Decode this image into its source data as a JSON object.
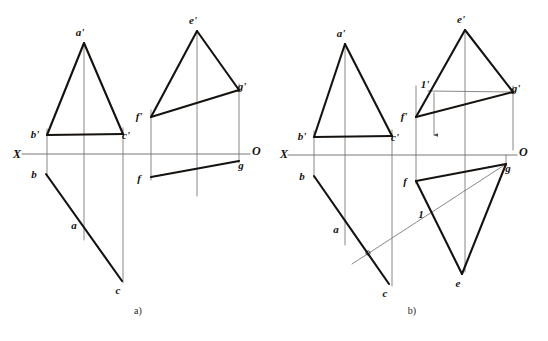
{
  "figure": {
    "type": "descriptive-geometry-projection-drawing",
    "background_color": "#ffffff",
    "ink_color": "#15120f",
    "thin_line_color": "#6e6a66",
    "captions": [
      {
        "id": "caption-a",
        "text": "a)",
        "x": 138,
        "y": 314
      },
      {
        "id": "caption-b",
        "text": "b)",
        "x": 412,
        "y": 314
      }
    ],
    "axes": [
      {
        "id": "axis-a",
        "x1": 22,
        "y1": 154,
        "x2": 250,
        "y2": 154,
        "left_label": "X",
        "left_label_x": 21,
        "left_label_y": 158,
        "right_label": "O",
        "right_label_x": 252,
        "right_label_y": 155
      },
      {
        "id": "axis-b",
        "x1": 288,
        "y1": 155,
        "x2": 517,
        "y2": 155,
        "left_label": "X",
        "left_label_x": 288,
        "left_label_y": 158,
        "right_label": "O",
        "right_label_x": 519,
        "right_label_y": 156
      }
    ],
    "panels": [
      {
        "id": "panel-a",
        "caption": "a)",
        "points": {
          "a_prime": {
            "label": "a'",
            "x": 84,
            "y": 43,
            "lx": 80,
            "ly": 36
          },
          "b_prime": {
            "label": "b'",
            "x": 47,
            "y": 135,
            "lx": 35,
            "ly": 138
          },
          "c_prime": {
            "label": "c'",
            "x": 123,
            "y": 134,
            "lx": 126,
            "ly": 139
          },
          "b": {
            "label": "b",
            "x": 46,
            "y": 174,
            "lx": 34,
            "ly": 178
          },
          "a": {
            "label": "a",
            "x": 76,
            "y": 218,
            "lx": 74,
            "ly": 229
          },
          "c": {
            "label": "c",
            "x": 122,
            "y": 281,
            "lx": 118,
            "ly": 294
          },
          "e_prime": {
            "label": "e'",
            "x": 197,
            "y": 31,
            "lx": 193,
            "ly": 24
          },
          "g_prime": {
            "label": "g'",
            "x": 239,
            "y": 90,
            "lx": 242,
            "ly": 90
          },
          "f_prime": {
            "label": "f'",
            "x": 151,
            "y": 117,
            "lx": 139,
            "ly": 120
          },
          "g": {
            "label": "g",
            "x": 239,
            "y": 161,
            "lx": 241,
            "ly": 169
          },
          "f": {
            "label": "f",
            "x": 151,
            "y": 177,
            "lx": 139,
            "ly": 182
          }
        }
      },
      {
        "id": "panel-b",
        "caption": "b)",
        "points": {
          "a_prime": {
            "label": "a'",
            "x": 345,
            "y": 44,
            "lx": 341,
            "ly": 37
          },
          "b_prime": {
            "label": "b'",
            "x": 314,
            "y": 137,
            "lx": 302,
            "ly": 140
          },
          "c_prime": {
            "label": "c'",
            "x": 392,
            "y": 136,
            "lx": 395,
            "ly": 141
          },
          "b": {
            "label": "b",
            "x": 314,
            "y": 176,
            "lx": 302,
            "ly": 180
          },
          "a": {
            "label": "a",
            "x": 339,
            "y": 222,
            "lx": 336,
            "ly": 233
          },
          "c": {
            "label": "c",
            "x": 389,
            "y": 284,
            "lx": 385,
            "ly": 297
          },
          "k": {
            "label": "",
            "x": 368,
            "y": 253,
            "lx": 0,
            "ly": 0
          },
          "e_prime": {
            "label": "e'",
            "x": 465,
            "y": 30,
            "lx": 461,
            "ly": 23
          },
          "g_prime": {
            "label": "g'",
            "x": 513,
            "y": 92,
            "lx": 516,
            "ly": 92
          },
          "one_prime": {
            "label": "1'",
            "x": 434,
            "y": 91,
            "lx": 425,
            "ly": 88
          },
          "f_prime": {
            "label": "f'",
            "x": 416,
            "y": 117,
            "lx": 404,
            "ly": 120
          },
          "g": {
            "label": "g",
            "x": 506,
            "y": 164,
            "lx": 508,
            "ly": 172
          },
          "f": {
            "label": "f",
            "x": 416,
            "y": 181,
            "lx": 405,
            "ly": 185
          },
          "one": {
            "label": "1",
            "x": 429,
            "y": 212,
            "lx": 421,
            "ly": 218
          },
          "e": {
            "label": "e",
            "x": 462,
            "y": 274,
            "lx": 458,
            "ly": 287
          }
        }
      }
    ],
    "segments_thick_a": [
      {
        "name": "abc-prime-left",
        "x1": 84,
        "y1": 43,
        "x2": 47,
        "y2": 135
      },
      {
        "name": "abc-prime-right",
        "x1": 84,
        "y1": 43,
        "x2": 123,
        "y2": 134
      },
      {
        "name": "abc-prime-base",
        "x1": 47,
        "y1": 135,
        "x2": 123,
        "y2": 134
      },
      {
        "name": "bc-horizontal-proj",
        "x1": 46,
        "y1": 174,
        "x2": 122,
        "y2": 281
      },
      {
        "name": "efg-prime-left",
        "x1": 197,
        "y1": 31,
        "x2": 151,
        "y2": 117
      },
      {
        "name": "efg-prime-right",
        "x1": 197,
        "y1": 31,
        "x2": 239,
        "y2": 90
      },
      {
        "name": "efg-prime-base",
        "x1": 151,
        "y1": 117,
        "x2": 239,
        "y2": 90
      },
      {
        "name": "efg-base-horizontal",
        "x1": 151,
        "y1": 177,
        "x2": 239,
        "y2": 161
      }
    ],
    "segments_thin_a": [
      {
        "name": "recall-b",
        "x1": 47,
        "y1": 129,
        "x2": 47,
        "y2": 176
      },
      {
        "name": "recall-c",
        "x1": 123,
        "y1": 128,
        "x2": 123,
        "y2": 283
      },
      {
        "name": "recall-a",
        "x1": 84,
        "y1": 43,
        "x2": 84,
        "y2": 240
      },
      {
        "name": "recall-f",
        "x1": 151,
        "y1": 110,
        "x2": 151,
        "y2": 180
      },
      {
        "name": "recall-g",
        "x1": 239,
        "y1": 84,
        "x2": 239,
        "y2": 163
      },
      {
        "name": "recall-e",
        "x1": 197,
        "y1": 31,
        "x2": 197,
        "y2": 196
      }
    ],
    "segments_thick_b": [
      {
        "name": "abc-prime-left",
        "x1": 345,
        "y1": 44,
        "x2": 314,
        "y2": 137
      },
      {
        "name": "abc-prime-right",
        "x1": 345,
        "y1": 44,
        "x2": 392,
        "y2": 136
      },
      {
        "name": "abc-prime-base",
        "x1": 314,
        "y1": 137,
        "x2": 392,
        "y2": 136
      },
      {
        "name": "bc-horizontal-proj",
        "x1": 314,
        "y1": 176,
        "x2": 389,
        "y2": 284
      },
      {
        "name": "efg-prime-left",
        "x1": 465,
        "y1": 30,
        "x2": 416,
        "y2": 117
      },
      {
        "name": "efg-prime-right",
        "x1": 465,
        "y1": 30,
        "x2": 513,
        "y2": 92
      },
      {
        "name": "efg-prime-base",
        "x1": 416,
        "y1": 117,
        "x2": 513,
        "y2": 92
      },
      {
        "name": "efg-top-edge",
        "x1": 416,
        "y1": 181,
        "x2": 506,
        "y2": 164
      },
      {
        "name": "efg-left-edge",
        "x1": 416,
        "y1": 181,
        "x2": 462,
        "y2": 274
      },
      {
        "name": "efg-right-edge",
        "x1": 506,
        "y1": 164,
        "x2": 462,
        "y2": 274
      }
    ],
    "segments_thin_b": [
      {
        "name": "recall-b",
        "x1": 314,
        "y1": 131,
        "x2": 314,
        "y2": 178
      },
      {
        "name": "recall-c",
        "x1": 392,
        "y1": 130,
        "x2": 392,
        "y2": 286
      },
      {
        "name": "recall-a",
        "x1": 345,
        "y1": 44,
        "x2": 345,
        "y2": 245
      },
      {
        "name": "recall-f",
        "x1": 416,
        "y1": 86,
        "x2": 416,
        "y2": 184
      },
      {
        "name": "recall-g",
        "x1": 513,
        "y1": 86,
        "x2": 513,
        "y2": 150
      },
      {
        "name": "recall-g-lower",
        "x1": 506,
        "y1": 155,
        "x2": 506,
        "y2": 166
      },
      {
        "name": "recall-e",
        "x1": 465,
        "y1": 30,
        "x2": 465,
        "y2": 272
      },
      {
        "name": "one-prime-to-g-prime",
        "x1": 428,
        "y1": 91,
        "x2": 513,
        "y2": 92
      },
      {
        "name": "g-to-bc-intersection",
        "x1": 506,
        "y1": 164,
        "x2": 352,
        "y2": 264
      },
      {
        "name": "projector-one",
        "x1": 434,
        "y1": 93,
        "x2": 434,
        "y2": 135
      }
    ]
  }
}
